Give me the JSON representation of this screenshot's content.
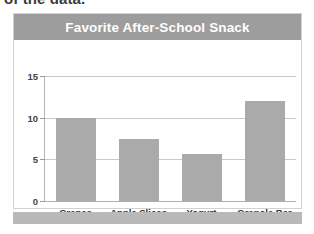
{
  "page": {
    "cutoff_text": "of the data."
  },
  "card": {
    "title": "Favorite After-School Snack"
  },
  "chart_data": {
    "type": "bar",
    "title": "Favorite After-School Snack",
    "xlabel": "",
    "ylabel": "",
    "categories": [
      "Grapes",
      "Apple Slices",
      "Yogurt",
      "Granola Bar"
    ],
    "values": [
      10,
      7.5,
      5.7,
      12
    ],
    "ylim": [
      0,
      15
    ],
    "yticks": [
      0,
      5,
      10,
      15
    ],
    "ytick_labels": [
      "0",
      "5",
      "10",
      "15"
    ],
    "grid": true,
    "legend": "none",
    "bar_color": "#aaaaaa",
    "header_color": "#9d9d9d",
    "title_color": "#ffffff"
  }
}
